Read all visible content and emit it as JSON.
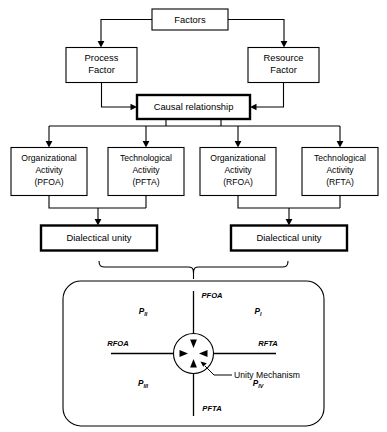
{
  "diagram": {
    "colors": {
      "stroke": "#000000",
      "background": "#ffffff",
      "box_fill": "#ffffff"
    },
    "nodes": {
      "factors": {
        "label": "Factors"
      },
      "process_factor": {
        "line1": "Process",
        "line2": "Factor"
      },
      "resource_factor": {
        "line1": "Resource",
        "line2": "Factor"
      },
      "causal_relationship": {
        "label": "Causal relationship"
      },
      "activity_pfoa": {
        "line1": "Organizational",
        "line2": "Activity",
        "line3": "(PFOA)"
      },
      "activity_pfta": {
        "line1": "Technological",
        "line2": "Activity",
        "line3": "(PFTA)"
      },
      "activity_rfoa": {
        "line1": "Organizational",
        "line2": "Activity",
        "line3": "(RFOA)"
      },
      "activity_rfta": {
        "line1": "Technological",
        "line2": "Activity",
        "line3": "(RFTA)"
      },
      "dialectical_unity_left": {
        "label": "Dialectical unity"
      },
      "dialectical_unity_right": {
        "label": "Dialectical unity"
      }
    },
    "quadrant_panel": {
      "axes": {
        "top": "PFOA",
        "bottom": "PFTA",
        "left": "RFOA",
        "right": "RFTA"
      },
      "quadrants": [
        {
          "id": "top-left",
          "base": "P",
          "subscript": "II"
        },
        {
          "id": "top-right",
          "base": "P",
          "subscript": "I"
        },
        {
          "id": "bottom-left",
          "base": "P",
          "subscript": "III"
        },
        {
          "id": "bottom-right",
          "base": "P",
          "subscript": "IV"
        }
      ],
      "center_annotation": "Unity Mechanism"
    }
  }
}
